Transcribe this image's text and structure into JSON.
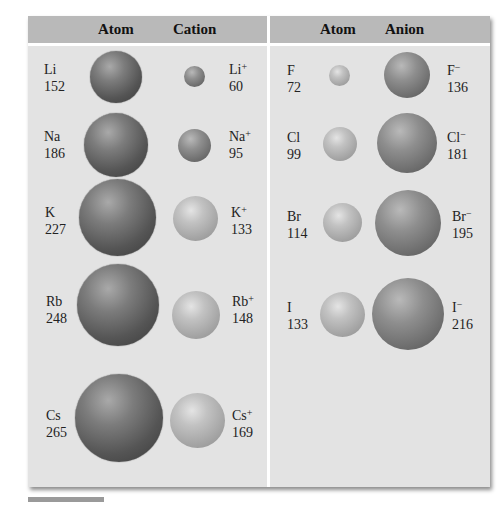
{
  "header": {
    "left": {
      "col1": "Atom",
      "col2": "Cation"
    },
    "right": {
      "col1": "Atom",
      "col2": "Anion"
    }
  },
  "cations": [
    {
      "atom": "Li",
      "atom_radius": "152",
      "ion": "Li",
      "charge": "+",
      "ion_radius": "60"
    },
    {
      "atom": "Na",
      "atom_radius": "186",
      "ion": "Na",
      "charge": "+",
      "ion_radius": "95"
    },
    {
      "atom": "K",
      "atom_radius": "227",
      "ion": "K",
      "charge": "+",
      "ion_radius": "133"
    },
    {
      "atom": "Rb",
      "atom_radius": "248",
      "ion": "Rb",
      "charge": "+",
      "ion_radius": "148"
    },
    {
      "atom": "Cs",
      "atom_radius": "265",
      "ion": "Cs",
      "charge": "+",
      "ion_radius": "169"
    }
  ],
  "anions": [
    {
      "atom": "F",
      "atom_radius": "72",
      "ion": "F",
      "charge": "−",
      "ion_radius": "136"
    },
    {
      "atom": "Cl",
      "atom_radius": "99",
      "ion": "Cl",
      "charge": "−",
      "ion_radius": "181"
    },
    {
      "atom": "Br",
      "atom_radius": "114",
      "ion": "Br",
      "charge": "−",
      "ion_radius": "195"
    },
    {
      "atom": "I",
      "atom_radius": "133",
      "ion": "I",
      "charge": "−",
      "ion_radius": "216"
    }
  ],
  "colors": {
    "panel_bg": "#e3e3e3",
    "header_bg": "#b9b9b9",
    "divider": "#ffffff"
  }
}
